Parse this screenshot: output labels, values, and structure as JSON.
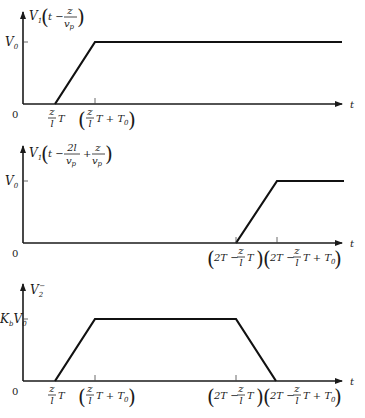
{
  "figure": {
    "panels": [
      {
        "id": "top",
        "ylabel": {
          "var": "V",
          "sub": "1",
          "arg_prefix": "t −",
          "frac_num": "z",
          "frac_den": "v",
          "frac_den_sub": "p"
        },
        "ylevel_label": {
          "main": "V",
          "sub": "0"
        },
        "origin_label": "0",
        "xaxis_label": "t",
        "xticks": [
          {
            "id": "t1",
            "label_num": "z",
            "label_den": "l",
            "label_suffix": "T",
            "paren": false
          },
          {
            "id": "t2",
            "label_num": "z",
            "label_den": "l",
            "label_suffix": "T + T",
            "label_suffix_sub": "0",
            "paren": true
          }
        ],
        "shape": "ramp-up"
      },
      {
        "id": "middle",
        "ylabel": {
          "var": "V",
          "sub": "1",
          "arg_prefix": "t −",
          "frac1_num": "2l",
          "frac1_den": "v",
          "frac1_den_sub": "p",
          "op": "+",
          "frac2_num": "z",
          "frac2_den": "v",
          "frac2_den_sub": "p"
        },
        "ylevel_label": {
          "main": "V",
          "sub": "0"
        },
        "origin_label": "0",
        "xaxis_label": "t",
        "xticks": [
          {
            "id": "t3",
            "prefix": "2T −",
            "label_num": "z",
            "label_den": "l",
            "label_suffix": "T",
            "paren": true
          },
          {
            "id": "t4",
            "prefix": "2T −",
            "label_num": "z",
            "label_den": "l",
            "label_suffix": "T + T",
            "label_suffix_sub": "0",
            "paren": true
          }
        ],
        "shape": "delayed-ramp-up"
      },
      {
        "id": "bottom",
        "ylabel": {
          "var": "V",
          "sub": "2",
          "sup": "−"
        },
        "ylevel_label": {
          "coef": "K",
          "coef_sub": "b",
          "main": "V",
          "sub": "0"
        },
        "origin_label": "0",
        "xaxis_label": "t",
        "xticks": [
          {
            "id": "t1",
            "label_num": "z",
            "label_den": "l",
            "label_suffix": "T",
            "paren": false
          },
          {
            "id": "t2",
            "label_num": "z",
            "label_den": "l",
            "label_suffix": "T + T",
            "label_suffix_sub": "0",
            "paren": true
          },
          {
            "id": "t3",
            "prefix": "2T −",
            "label_num": "z",
            "label_den": "l",
            "label_suffix": "T",
            "paren": true
          },
          {
            "id": "t4",
            "prefix": "2T −",
            "label_num": "z",
            "label_den": "l",
            "label_suffix": "T + T",
            "label_suffix_sub": "0",
            "paren": true
          }
        ],
        "shape": "trapezoid"
      }
    ],
    "colors": {
      "line": "#111111",
      "axis": "#1a1a1a",
      "background": "#ffffff"
    }
  }
}
